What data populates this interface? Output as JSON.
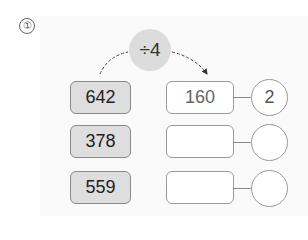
{
  "problem": {
    "number": "①",
    "operator": "÷4",
    "rows": [
      {
        "dividend": "642",
        "quotient": "160",
        "remainder": "2"
      },
      {
        "dividend": "378",
        "quotient": "",
        "remainder": ""
      },
      {
        "dividend": "559",
        "quotient": "",
        "remainder": ""
      }
    ]
  }
}
